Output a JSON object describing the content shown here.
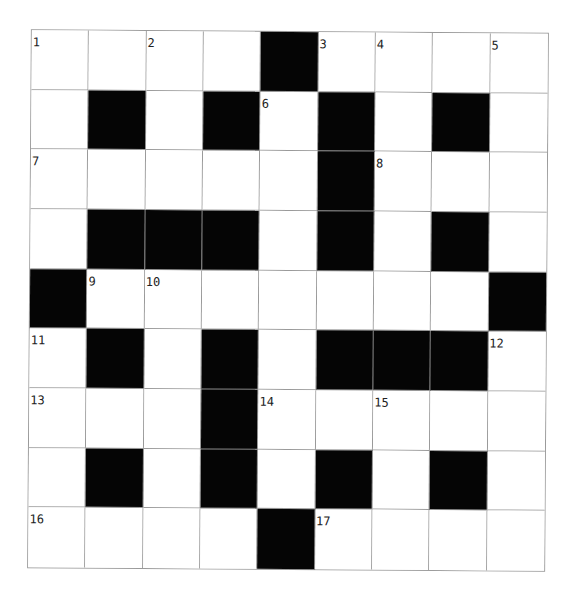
{
  "puzzle": {
    "rows": 9,
    "cols": 9,
    "block_color": "#050505",
    "line_color": "#9a9a9a",
    "grid": [
      [
        "1",
        "",
        "2",
        "",
        "#",
        "3",
        "4",
        "",
        "5"
      ],
      [
        "",
        "#",
        "",
        "#",
        "6",
        "#",
        "",
        "#",
        ""
      ],
      [
        "7",
        "",
        "",
        "",
        "",
        "#",
        "8",
        "",
        ""
      ],
      [
        "",
        "#",
        "#",
        "#",
        "",
        "#",
        "",
        "#",
        ""
      ],
      [
        "#",
        "9",
        "10",
        "",
        "",
        "",
        "",
        "",
        "#"
      ],
      [
        "11",
        "#",
        "",
        "#",
        "",
        "#",
        "#",
        "#",
        "12"
      ],
      [
        "13",
        "",
        "",
        "#",
        "14",
        "",
        "15",
        "",
        ""
      ],
      [
        "",
        "#",
        "",
        "#",
        "",
        "#",
        "",
        "#",
        ""
      ],
      [
        "16",
        "",
        "",
        "",
        "#",
        "17",
        "",
        "",
        ""
      ]
    ],
    "clue_numbers": [
      "1",
      "2",
      "3",
      "4",
      "5",
      "6",
      "7",
      "8",
      "9",
      "10",
      "11",
      "12",
      "13",
      "14",
      "15",
      "16",
      "17"
    ]
  }
}
